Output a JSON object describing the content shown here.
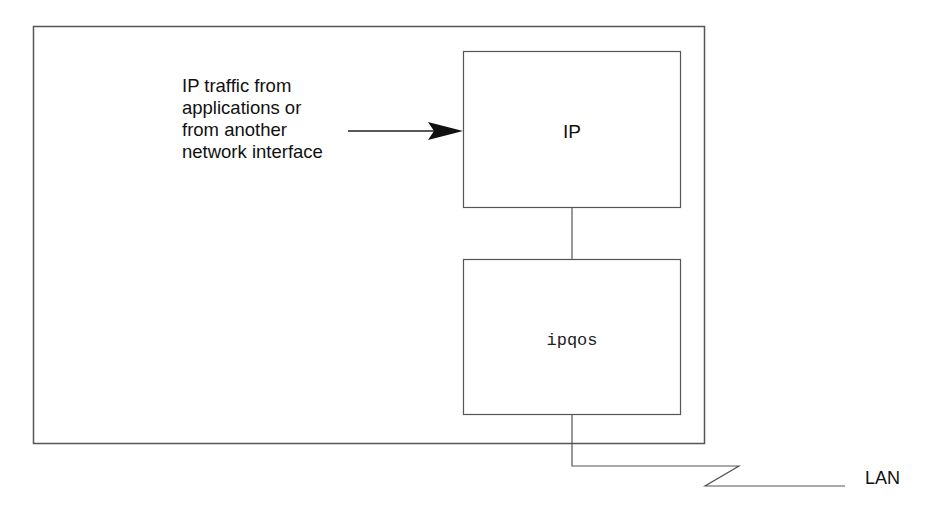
{
  "diagram": {
    "input_label_lines": [
      "IP traffic from",
      "applications or",
      "from another",
      "network interface"
    ],
    "ip_box_label": "IP",
    "ipqos_box_label": "ipqos",
    "lan_label": "LAN",
    "colors": {
      "line": "#555555",
      "text": "#111111",
      "background": "#ffffff"
    }
  }
}
